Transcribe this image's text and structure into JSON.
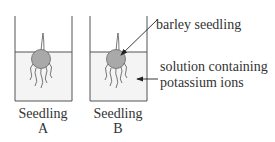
{
  "diagram": {
    "labels": {
      "seedling": "barley seedling",
      "solution_line1": "solution containing",
      "solution_line2": "potassium ions"
    },
    "beakers": [
      {
        "caption_line1": "Seedling",
        "caption_line2": "A"
      },
      {
        "caption_line1": "Seedling",
        "caption_line2": "B"
      }
    ],
    "colors": {
      "solution": "#f4f4f4",
      "seed": "#a9a9a9",
      "line": "#555555"
    }
  }
}
